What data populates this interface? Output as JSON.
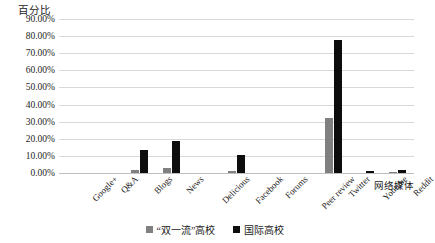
{
  "chart_data": {
    "type": "bar",
    "title": "",
    "ylabel": "百分比",
    "xlabel": "网络媒体",
    "ylim": [
      0,
      90
    ],
    "ytick_labels": [
      "90.00%",
      "80.00%",
      "70.00%",
      "60.00%",
      "50.00%",
      "40.00%",
      "30.00%",
      "20.00%",
      "10.00%",
      "0.00%"
    ],
    "ytick_values": [
      90,
      80,
      70,
      60,
      50,
      40,
      30,
      20,
      10,
      0
    ],
    "grid": true,
    "legend_position": "bottom",
    "categories": [
      "Google+",
      "Q&A",
      "Blogs",
      "News",
      "Delicious",
      "Facebook",
      "Forums",
      "Peer review",
      "Twitter",
      "Youtube",
      "Reddit"
    ],
    "series": [
      {
        "name": "“双一流”高校",
        "color": "#808080",
        "values": [
          0,
          0,
          1.5,
          3.0,
          0,
          1.0,
          0,
          0,
          32.0,
          0,
          0.5
        ]
      },
      {
        "name": "国际高校",
        "color": "#0d0d0d",
        "values": [
          0,
          0,
          13.5,
          18.5,
          0,
          10.5,
          0,
          0,
          78.0,
          1.0,
          2.0
        ]
      }
    ]
  },
  "legend": {
    "items": [
      {
        "label": "“双一流”高校",
        "color": "#808080"
      },
      {
        "label": "国际高校",
        "color": "#0d0d0d"
      }
    ]
  }
}
